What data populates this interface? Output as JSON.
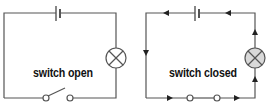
{
  "diagrams": [
    {
      "id": "open",
      "label": "switch open",
      "lamp_fill": "#ffffff",
      "components": [
        "battery",
        "lamp",
        "open-switch"
      ]
    },
    {
      "id": "closed",
      "label": "switch closed",
      "lamp_fill": "#d9d9d9",
      "components": [
        "battery",
        "lamp",
        "closed-switch",
        "current-arrows"
      ]
    }
  ],
  "colors": {
    "wire": "#555555",
    "text": "#111111"
  }
}
